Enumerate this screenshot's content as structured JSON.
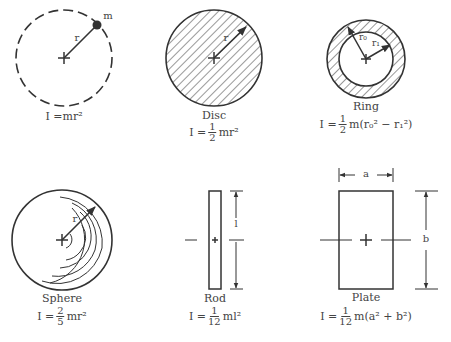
{
  "figures": {
    "point_mass": {
      "label": "",
      "mass_label": "m",
      "radius_label": "r",
      "formula": {
        "lhs": "I = ",
        "rhs": "mr²"
      }
    },
    "disc": {
      "label": "Disc",
      "radius_label": "r",
      "formula": {
        "lhs": "I = ",
        "num": "1",
        "den": "2",
        "rhs": "mr²"
      }
    },
    "ring": {
      "label": "Ring",
      "outer_radius_label": "r₀",
      "inner_radius_label": "r₁",
      "formula": {
        "lhs": "I = ",
        "num": "1",
        "den": "2",
        "rhs": "m(r₀² − r₁²)"
      }
    },
    "sphere": {
      "label": "Sphere",
      "radius_label": "r",
      "formula": {
        "lhs": "I = ",
        "num": "2",
        "den": "5",
        "rhs": "mr²"
      }
    },
    "rod": {
      "label": "Rod",
      "length_label": "l",
      "formula": {
        "lhs": "I = ",
        "num": "1",
        "den": "12",
        "rhs": "ml²"
      }
    },
    "plate": {
      "label": "Plate",
      "width_label": "a",
      "height_label": "b",
      "formula": {
        "lhs": "I = ",
        "num": "1",
        "den": "12",
        "rhs": "m(a² + b²)"
      }
    }
  },
  "colors": {
    "stroke": "#333333",
    "text": "#444444",
    "background": "#ffffff"
  }
}
